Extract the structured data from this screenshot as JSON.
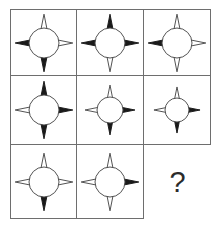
{
  "puzzle": {
    "type": "matrix-reasoning",
    "title": "Four-pointed star matrix puzzle",
    "rows": 3,
    "columns": 3,
    "colors": {
      "fill": "#1a1a1a",
      "stroke": "#4a4a4a",
      "circle": "#ffffff",
      "grid": "#6e6e6e",
      "background": "#ffffff",
      "question_mark": "#2b2b2b"
    },
    "petal_order": [
      "top",
      "right",
      "bottom",
      "left"
    ],
    "cells": [
      {
        "id": "cell-r1c1",
        "position": "row 1, column 1",
        "size": "large",
        "filled_petals": [
          "left",
          "bottom"
        ],
        "outline_petals": [
          "top",
          "right"
        ],
        "filled_count": 2
      },
      {
        "id": "cell-r1c2",
        "position": "row 1, column 2",
        "size": "large",
        "filled_petals": [
          "top",
          "right",
          "left"
        ],
        "outline_petals": [
          "bottom"
        ],
        "filled_count": 3
      },
      {
        "id": "cell-r1c3",
        "position": "row 1, column 3",
        "size": "large",
        "filled_petals": [
          "left"
        ],
        "outline_petals": [
          "top",
          "right",
          "bottom"
        ],
        "filled_count": 1
      },
      {
        "id": "cell-r2c1",
        "position": "row 2, column 1",
        "size": "large",
        "filled_petals": [
          "top",
          "right",
          "bottom"
        ],
        "outline_petals": [
          "left"
        ],
        "filled_count": 3
      },
      {
        "id": "cell-r2c2",
        "position": "row 2, column 2",
        "size": "medium",
        "filled_petals": [
          "right",
          "bottom"
        ],
        "outline_petals": [
          "top",
          "left"
        ],
        "filled_count": 2
      },
      {
        "id": "cell-r2c3",
        "position": "row 2, column 3",
        "size": "small",
        "filled_petals": [
          "right",
          "bottom"
        ],
        "outline_petals": [
          "top",
          "left"
        ],
        "filled_count": 2
      },
      {
        "id": "cell-r3c1",
        "position": "row 3, column 1",
        "size": "large",
        "filled_petals": [
          "bottom"
        ],
        "outline_petals": [
          "top",
          "right",
          "left"
        ],
        "filled_count": 1
      },
      {
        "id": "cell-r3c2",
        "position": "row 3, column 2",
        "size": "large",
        "filled_petals": [
          "right"
        ],
        "outline_petals": [
          "top",
          "bottom",
          "left"
        ],
        "filled_count": 1
      },
      {
        "id": "cell-r3c3",
        "position": "row 3, column 3",
        "size": "none",
        "is_answer_slot": true,
        "label": "?",
        "filled_petals": [],
        "outline_petals": [],
        "filled_count": 0
      }
    ]
  }
}
